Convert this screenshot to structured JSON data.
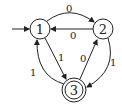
{
  "diagram": {
    "type": "finite-automaton",
    "start_state": "1",
    "states": [
      {
        "id": "1",
        "label": "1",
        "accepting": false,
        "cx": 40,
        "cy": 29
      },
      {
        "id": "2",
        "label": "2",
        "accepting": false,
        "cx": 103,
        "cy": 29
      },
      {
        "id": "3",
        "label": "3",
        "accepting": true,
        "cx": 74,
        "cy": 90
      }
    ],
    "transitions": [
      {
        "from": "1",
        "to": "2",
        "label": "0"
      },
      {
        "from": "2",
        "to": "1",
        "label": "0"
      },
      {
        "from": "1",
        "to": "3",
        "label": "1"
      },
      {
        "from": "3",
        "to": "2",
        "label": "0"
      },
      {
        "from": "2",
        "to": "3",
        "label": "1"
      },
      {
        "from": "3",
        "to": "1",
        "label": "1"
      }
    ],
    "colors": {
      "stroke": "#222222",
      "background": "#ffffff"
    }
  }
}
